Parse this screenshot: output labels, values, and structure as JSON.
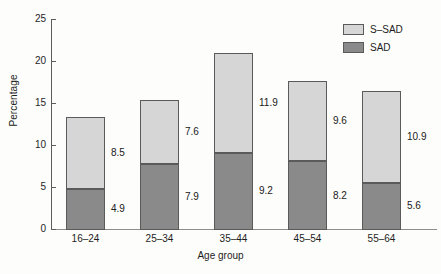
{
  "chart_data": {
    "type": "bar",
    "stacked": true,
    "title": "",
    "xlabel": "Age group",
    "ylabel": "Percentage",
    "categories": [
      "16–24",
      "25–34",
      "35–44",
      "45–54",
      "55–64"
    ],
    "series": [
      {
        "name": "SAD",
        "values": [
          4.9,
          7.9,
          9.2,
          8.2,
          5.6
        ],
        "color": "#8a8a8a"
      },
      {
        "name": "S–SAD",
        "values": [
          8.5,
          7.6,
          11.9,
          9.6,
          10.9
        ],
        "color": "#d6d6d6"
      }
    ],
    "totals": [
      13.4,
      15.5,
      21.1,
      17.8,
      16.5
    ],
    "ylim": [
      0,
      25
    ],
    "yticks": [
      "0",
      "5",
      "10",
      "15",
      "20",
      "25"
    ],
    "ytick_values": [
      0,
      5,
      10,
      15,
      20,
      25
    ],
    "grid": false,
    "legend_position": "top-right",
    "data_labels": {
      "sad": [
        "4.9",
        "7.9",
        "9.2",
        "8.2",
        "5.6"
      ],
      "ssad": [
        "8.5",
        "7.6",
        "11.9",
        "9.6",
        "10.9"
      ]
    }
  },
  "legend": {
    "items": [
      {
        "label": "S–SAD",
        "color": "#d6d6d6"
      },
      {
        "label": "SAD",
        "color": "#8a8a8a"
      }
    ]
  },
  "axes": {
    "y_title": "Percentage",
    "x_title": "Age group"
  }
}
